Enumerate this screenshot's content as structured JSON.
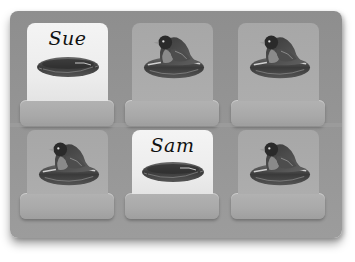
{
  "game": {
    "type": "memory-match",
    "grid": {
      "rows": 2,
      "cols": 3
    }
  },
  "cards": [
    {
      "index": 0,
      "row": 0,
      "col": 0,
      "state": "face-up",
      "name": "Sue",
      "image": "empty-nest"
    },
    {
      "index": 1,
      "row": 0,
      "col": 1,
      "state": "face-down",
      "name": "",
      "image": "bird-in-nest"
    },
    {
      "index": 2,
      "row": 0,
      "col": 2,
      "state": "face-down",
      "name": "",
      "image": "bird-in-nest"
    },
    {
      "index": 3,
      "row": 1,
      "col": 0,
      "state": "face-down",
      "name": "",
      "image": "bird-in-nest"
    },
    {
      "index": 4,
      "row": 1,
      "col": 1,
      "state": "face-up",
      "name": "Sam",
      "image": "empty-nest"
    },
    {
      "index": 5,
      "row": 1,
      "col": 2,
      "state": "face-down",
      "name": "",
      "image": "bird-in-nest"
    }
  ],
  "colors": {
    "board": "#959595",
    "card_face_up": "#efefef",
    "card_face_down": "#aaaaaa",
    "shelf": "#acacac",
    "text": "#111111"
  }
}
